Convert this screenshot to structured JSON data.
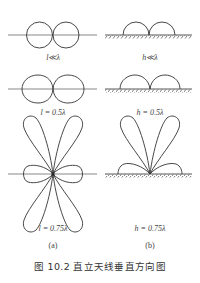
{
  "figure": {
    "caption": "图 10.2    直立天线垂直方向图",
    "columns": [
      {
        "sublabel": "(a)",
        "description": "free-space vertical antenna patterns"
      },
      {
        "sublabel": "(b)",
        "description": "vertical antenna above ground patterns"
      }
    ],
    "panels": [
      {
        "id": "a1",
        "label": "l≪λ",
        "pattern": "two-circle-dipole"
      },
      {
        "id": "b1",
        "label": "h≪λ",
        "pattern": "two-semicircles-ground"
      },
      {
        "id": "a2",
        "label": "l = 0.5λ",
        "pattern": "two-oval-dipole"
      },
      {
        "id": "b2",
        "label": "h = 0.5λ",
        "pattern": "two-wide-semicircles-ground"
      },
      {
        "id": "a3",
        "label": "l = 0.75λ",
        "pattern": "six-lobe"
      },
      {
        "id": "b3",
        "label": "h = 0.75λ",
        "pattern": "upward-lobes-with-side-lobes-ground"
      }
    ],
    "colors": {
      "stroke": "#333333",
      "axis": "#555555",
      "text": "#444444"
    }
  }
}
